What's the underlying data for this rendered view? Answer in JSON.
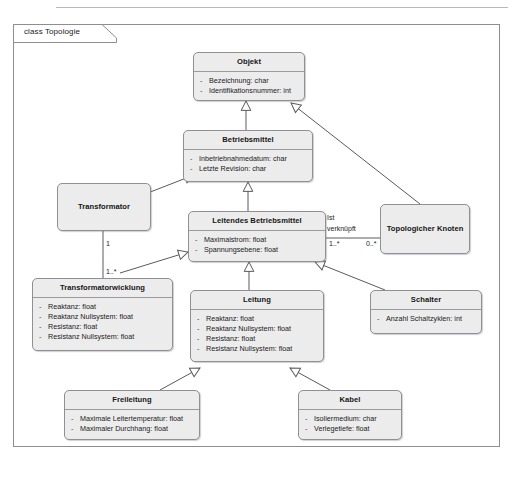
{
  "frame": {
    "label": "class Topologie"
  },
  "classes": [
    {
      "id": "objekt",
      "name": "Objekt",
      "attributes": [
        "Bezeichnung: char",
        "Identifikationsnummer: int"
      ]
    },
    {
      "id": "betriebsmittel",
      "name": "Betriebsmittel",
      "attributes": [
        "Inbetriebnahmedatum: char",
        "Letzte Revision: char"
      ]
    },
    {
      "id": "leitendes-betriebsmittel",
      "name": "Leitendes Betriebsmittel",
      "attributes": [
        "Maximalstrom: float",
        "Spannungsebene: float"
      ]
    },
    {
      "id": "transformator",
      "name": "Transformator",
      "attributes": []
    },
    {
      "id": "topologicher-knoten",
      "name": "Topologicher Knoten",
      "attributes": []
    },
    {
      "id": "transformatorwicklung",
      "name": "Transformatorwicklung",
      "attributes": [
        "Reaktanz: float",
        "Reaktanz Nullsystem: float",
        "Resistanz: float",
        "Resistanz Nullsystem: float"
      ]
    },
    {
      "id": "leitung",
      "name": "Leitung",
      "attributes": [
        "Reaktanz: float",
        "Reaktanz Nullsystem: float",
        "Resistanz: float",
        "Resistanz Nullsystem: float"
      ]
    },
    {
      "id": "schalter",
      "name": "Schalter",
      "attributes": [
        "Anzahl Schaltzyklen: int"
      ]
    },
    {
      "id": "freileitung",
      "name": "Freileitung",
      "attributes": [
        "Maximale Leitertemperatur: float",
        "Maximaler Durchhang: float"
      ]
    },
    {
      "id": "kabel",
      "name": "Kabel",
      "attributes": [
        "Isoliermedium: char",
        "Verlegetiefe: float"
      ]
    }
  ],
  "edge_labels": {
    "association_name_line1": "Ist",
    "association_name_line2": "verknüpft",
    "leitendes_multiplicity": "1..*",
    "knoten_multiplicity": "0..*",
    "transformator_multiplicity": "1",
    "transformatorwicklung_multiplicity": "1..*"
  },
  "colors": {
    "box_fill": "#ececec",
    "box_border": "#8f8f94",
    "frame_border": "#8d8d92",
    "line": "#5a5a5e",
    "text": "#161616"
  }
}
